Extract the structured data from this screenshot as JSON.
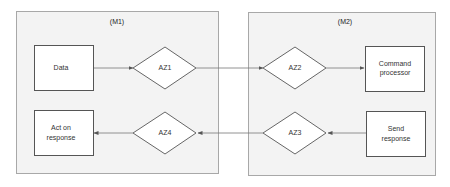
{
  "diagram": {
    "modules": [
      {
        "id": "M1",
        "label": "(M1)"
      },
      {
        "id": "M2",
        "label": "(M2)"
      }
    ],
    "nodes": {
      "data": {
        "line1": "Data"
      },
      "az1": {
        "label": "AZ1"
      },
      "az2": {
        "label": "AZ2"
      },
      "command_processor": {
        "line1": "Command",
        "line2": "processor"
      },
      "act_on_response": {
        "line1": "Act on",
        "line2": "response"
      },
      "az4": {
        "label": "AZ4"
      },
      "az3": {
        "label": "AZ3"
      },
      "send_response": {
        "line1": "Send",
        "line2": "response"
      }
    },
    "edges": [
      {
        "from": "Data",
        "to": "AZ1"
      },
      {
        "from": "AZ1",
        "to": "AZ2"
      },
      {
        "from": "AZ2",
        "to": "Command processor"
      },
      {
        "from": "Send response",
        "to": "AZ3"
      },
      {
        "from": "AZ3",
        "to": "AZ4"
      },
      {
        "from": "AZ4",
        "to": "Act on response"
      }
    ],
    "colors": {
      "module_fill": "#f3f3f3",
      "module_border": "#a8a8a8",
      "node_border": "#555555",
      "edge": "#777777"
    }
  }
}
